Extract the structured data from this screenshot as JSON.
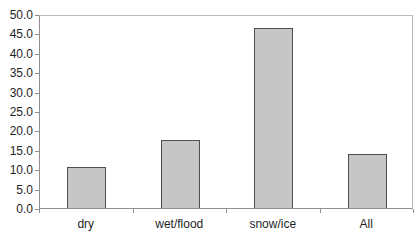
{
  "chart_data": {
    "type": "bar",
    "title": "",
    "xlabel": "",
    "ylabel": "",
    "categories": [
      "dry",
      "wet/flood",
      "snow/ice",
      "All"
    ],
    "values": [
      10.5,
      17.5,
      46.5,
      14.0
    ],
    "ylim": [
      0,
      50
    ],
    "ytick_step": 5,
    "ytick_labels": [
      "0.0",
      "5.0",
      "10.0",
      "15.0",
      "20.0",
      "25.0",
      "30.0",
      "35.0",
      "40.0",
      "45.0",
      "50.0"
    ],
    "grid": false,
    "legend": "none",
    "colors": {
      "background": "#ffffff",
      "bar_fill": "#c6c6c6",
      "bar_border": "#4f4f4f",
      "axis": "#8f8f8f",
      "plot_frame": "#b9b9b9",
      "text": "#1f1f1f"
    }
  }
}
